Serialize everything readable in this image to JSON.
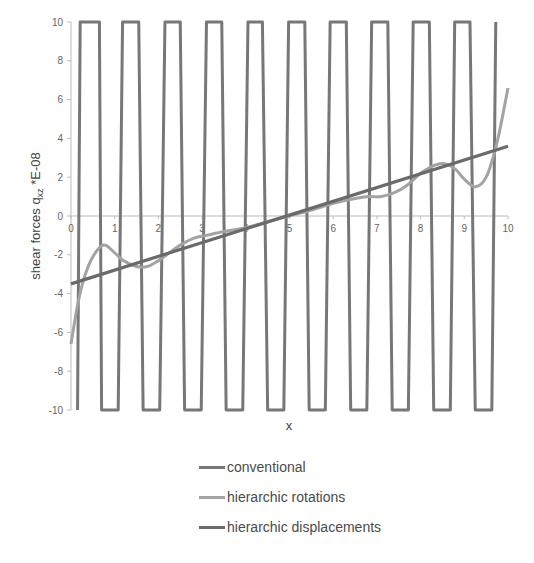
{
  "chart_data": {
    "type": "line",
    "title": "",
    "xlabel": "x",
    "ylabel": "shear forces q",
    "ylabel_subscript": "xz",
    "ylabel_suffix": " *E-08",
    "xlim": [
      0,
      10
    ],
    "ylim": [
      -10,
      10
    ],
    "x_ticks": [
      "0",
      "1",
      "2",
      "3",
      "4",
      "5",
      "6",
      "7",
      "8",
      "9",
      "10"
    ],
    "y_ticks": [
      "10",
      "8",
      "6",
      "4",
      "2",
      "0",
      "-2",
      "-4",
      "-6",
      "-8",
      "-10"
    ],
    "grid": false,
    "legend_position": "bottom",
    "series": [
      {
        "name": "conventional",
        "color": "#777777",
        "description": "high-frequency oscillation exceeding axis limits (clipped at ±10)",
        "x": [
          0.15,
          0.21,
          0.65,
          0.7,
          1.08,
          1.18,
          1.55,
          1.65,
          2.03,
          2.15,
          2.5,
          2.6,
          2.98,
          3.1,
          3.45,
          3.55,
          3.93,
          4.05,
          4.38,
          4.5,
          4.87,
          4.98,
          5.35,
          5.45,
          5.82,
          5.93,
          6.3,
          6.4,
          6.77,
          6.88,
          7.25,
          7.35,
          7.72,
          7.83,
          8.2,
          8.3,
          8.68,
          8.78,
          9.13,
          9.25,
          9.63,
          9.72
        ],
        "y": [
          -10,
          10,
          10,
          -10,
          -10,
          10,
          10,
          -10,
          -10,
          10,
          10,
          -10,
          -10,
          10,
          10,
          -10,
          -10,
          10,
          10,
          -10,
          -10,
          10,
          10,
          -10,
          -10,
          10,
          10,
          -10,
          -10,
          10,
          10,
          -10,
          -10,
          10,
          10,
          -10,
          -10,
          10,
          10,
          -10,
          -10,
          10
        ]
      },
      {
        "name": "hierarchic rotations",
        "color": "#a3a3a3",
        "x": [
          0,
          0.15,
          0.3,
          0.5,
          0.75,
          1.0,
          1.2,
          1.5,
          1.75,
          2.0,
          2.25,
          2.5,
          2.8,
          3.1,
          3.5,
          4.0,
          4.5,
          5.0,
          5.5,
          6.0,
          6.5,
          6.8,
          7.1,
          7.4,
          7.7,
          8.0,
          8.3,
          8.55,
          8.8,
          9.0,
          9.25,
          9.5,
          9.75,
          10.0
        ],
        "y": [
          -6.6,
          -4.6,
          -3.2,
          -2.1,
          -1.5,
          -1.9,
          -2.3,
          -2.6,
          -2.6,
          -2.3,
          -1.9,
          -1.5,
          -1.15,
          -1.0,
          -0.8,
          -0.6,
          -0.3,
          0.0,
          0.3,
          0.65,
          0.9,
          1.0,
          1.0,
          1.2,
          1.6,
          2.2,
          2.6,
          2.7,
          2.4,
          1.9,
          1.5,
          2.0,
          3.8,
          6.6
        ]
      },
      {
        "name": "hierarchic displacements",
        "color": "#6a6a6a",
        "x": [
          0,
          10
        ],
        "y": [
          -3.5,
          3.6
        ]
      }
    ]
  },
  "legend": {
    "items": [
      {
        "label": "conventional",
        "color": "#777777"
      },
      {
        "label": "hierarchic rotations",
        "color": "#a3a3a3"
      },
      {
        "label": "hierarchic displacements",
        "color": "#6a6a6a"
      }
    ]
  }
}
